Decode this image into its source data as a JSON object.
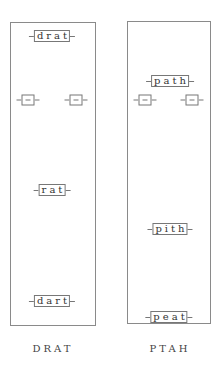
{
  "panels": [
    {
      "caption": "DRAT",
      "nodes": {
        "top": "drat",
        "left_empty": "",
        "right_empty": "",
        "middle": "rat",
        "bottom": "dart"
      }
    },
    {
      "caption": "PTAH",
      "nodes": {
        "top": "path",
        "left_empty": "",
        "right_empty": "",
        "middle": "pith",
        "bottom": "peat"
      }
    }
  ],
  "colors": {
    "border": "#8a8a8a",
    "text": "#333333",
    "background": "#ffffff"
  }
}
